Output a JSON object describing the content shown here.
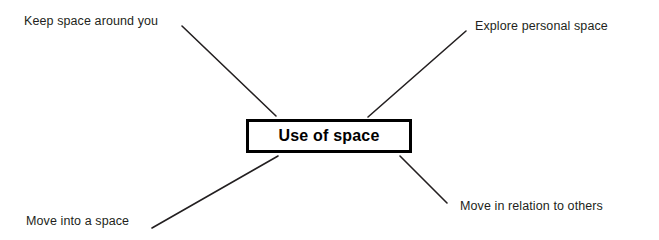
{
  "diagram": {
    "type": "mind-map",
    "title": "Use of space",
    "background_color": "#ffffff",
    "center": {
      "label": "Use of space",
      "border_color": "#000000",
      "text_color": "#000000",
      "fill_color": "#ffffff"
    },
    "branch_color": "#231f20",
    "branches": [
      {
        "id": "keep-space-around-you",
        "label": "Keep space around you",
        "position": "top-left",
        "line": {
          "x1": 182,
          "y1": 26,
          "x2": 276,
          "y2": 116
        }
      },
      {
        "id": "explore-personal-space",
        "label": "Explore personal space",
        "position": "top-right",
        "line": {
          "x1": 466,
          "y1": 31,
          "x2": 368,
          "y2": 117
        }
      },
      {
        "id": "move-into-a-space",
        "label": "Move into a space",
        "position": "bottom-left",
        "line": {
          "x1": 152,
          "y1": 228,
          "x2": 278,
          "y2": 156
        }
      },
      {
        "id": "move-in-relation-to-others",
        "label": "Move in relation to others",
        "position": "bottom-right",
        "line": {
          "x1": 400,
          "y1": 156,
          "x2": 447,
          "y2": 203
        }
      }
    ]
  }
}
